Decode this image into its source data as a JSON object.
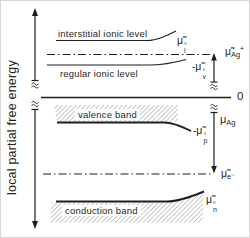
{
  "figure": {
    "background": "#ffffff",
    "line_color": "#1f1f1f",
    "hatch_color": "#a8a8a8"
  },
  "axis": {
    "label": "local partial free energy",
    "zero_label": "0"
  },
  "levels": {
    "interstitial": {
      "label": "interstitial ionic level",
      "symbol": {
        "prefix": "",
        "base": "μ̃",
        "sup": "°",
        "sub": "i"
      }
    },
    "regular": {
      "label": "regular ionic level",
      "symbol": {
        "prefix": "-",
        "base": "μ̃",
        "sup": "°",
        "sub": "v"
      }
    },
    "valence": {
      "label": "valence band",
      "symbol": {
        "prefix": "-",
        "base": "μ̃",
        "sup": "°",
        "sub": "p"
      }
    },
    "conduction": {
      "label": "conduction band",
      "symbol": {
        "prefix": "",
        "base": "μ̃",
        "sup": "°",
        "sub": "n"
      }
    }
  },
  "potentials": {
    "silver_ion": {
      "base": "μ̃",
      "sub": "Ag",
      "sup": "+"
    },
    "silver": {
      "base": "μ",
      "sub": "Ag",
      "sup": ""
    },
    "electron": {
      "base": "μ̃",
      "sub": "e⁻",
      "sup": ""
    }
  }
}
